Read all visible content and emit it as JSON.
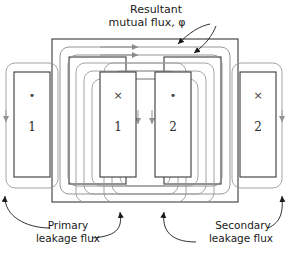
{
  "figure": {
    "background_color": "#ffffff",
    "core_color": "#3a3a3a",
    "flux_color": "#8a8a8a",
    "leader_color": "#1a1a1a",
    "text_color": "#1a1a1a"
  },
  "annotations": {
    "mutual_flux_line1": "Resultant",
    "mutual_flux_line2": "mutual flux, φ",
    "primary_line1": "Primary",
    "primary_line2": "leakage flux",
    "secondary_line1": "Secondary",
    "secondary_line2": "leakage flux"
  },
  "coils": [
    {
      "id": "coil-left-outer",
      "number": "1",
      "marker": "•",
      "marker_name": "current-out-of-page-dot",
      "winding": "primary"
    },
    {
      "id": "coil-left-inner",
      "number": "1",
      "marker": "×",
      "marker_name": "current-into-page-cross",
      "winding": "primary"
    },
    {
      "id": "coil-right-inner",
      "number": "2",
      "marker": "•",
      "marker_name": "current-out-of-page-dot",
      "winding": "secondary"
    },
    {
      "id": "coil-right-outer",
      "number": "2",
      "marker": "×",
      "marker_name": "current-into-page-cross",
      "winding": "secondary"
    }
  ],
  "flux_paths": {
    "mutual_count": 2,
    "primary_leakage_count": 3,
    "secondary_leakage_count": 3,
    "mutual_direction": "clockwise",
    "arrow_direction_top": "right",
    "arrow_direction_center_limb": "down"
  }
}
